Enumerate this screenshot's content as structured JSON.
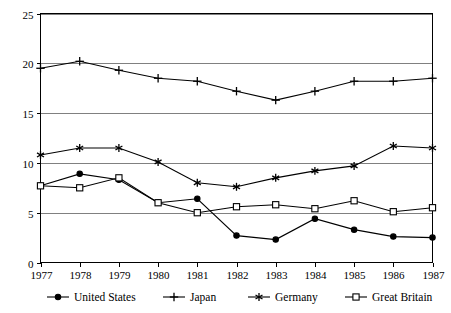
{
  "chart_data": {
    "type": "line",
    "title": "",
    "subtitle": "",
    "xlabel": "",
    "ylabel": "",
    "x": [
      1977,
      1978,
      1979,
      1980,
      1981,
      1982,
      1983,
      1984,
      1985,
      1986,
      1987
    ],
    "categories": [
      "1977",
      "1978",
      "1979",
      "1980",
      "1981",
      "1982",
      "1983",
      "1984",
      "1985",
      "1986",
      "1987"
    ],
    "xlim": [
      1977,
      1987
    ],
    "ylim": [
      0,
      25
    ],
    "yticks": [
      0,
      5,
      10,
      15,
      20,
      25
    ],
    "ytick_labels": [
      "0",
      "5",
      "10",
      "15",
      "20",
      "25"
    ],
    "grid": true,
    "grid_axis": "y",
    "legend_position": "bottom",
    "series": [
      {
        "name": "United States",
        "marker": "filled-circle",
        "color": "#000000",
        "values": [
          7.7,
          8.9,
          8.3,
          6.0,
          6.4,
          2.7,
          2.3,
          4.4,
          3.3,
          2.6,
          2.5
        ]
      },
      {
        "name": "Japan",
        "marker": "plus",
        "color": "#000000",
        "values": [
          19.5,
          20.2,
          19.3,
          18.5,
          18.2,
          17.2,
          16.3,
          17.2,
          18.2,
          18.2,
          18.5
        ]
      },
      {
        "name": "Germany",
        "marker": "asterisk",
        "color": "#000000",
        "values": [
          10.8,
          11.5,
          11.5,
          10.1,
          8.0,
          7.6,
          8.5,
          9.2,
          9.7,
          11.7,
          11.5
        ]
      },
      {
        "name": "Great Britain",
        "marker": "open-square",
        "color": "#000000",
        "values": [
          7.7,
          7.5,
          8.5,
          6.0,
          5.0,
          5.6,
          5.8,
          5.4,
          6.2,
          5.1,
          5.5
        ]
      }
    ]
  },
  "legend": {
    "items": [
      {
        "label": "United States",
        "marker": "filled-circle"
      },
      {
        "label": "Japan",
        "marker": "plus"
      },
      {
        "label": "Germany",
        "marker": "asterisk"
      },
      {
        "label": "Great Britain",
        "marker": "open-square"
      }
    ]
  },
  "colors": {
    "ink": "#000000",
    "gridline": "#808080",
    "background": "#ffffff"
  }
}
